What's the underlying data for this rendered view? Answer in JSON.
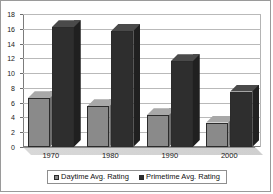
{
  "chart_data": {
    "type": "bar",
    "title": "",
    "xlabel": "",
    "ylabel": "",
    "categories": [
      "1970",
      "1980",
      "1990",
      "2000"
    ],
    "series": [
      {
        "name": "Daytime Avg. Rating",
        "color": "#8a8a8a",
        "values": [
          6.6,
          5.5,
          4.3,
          3.3
        ]
      },
      {
        "name": "Primetime Avg. Rating",
        "color": "#2e2e2e",
        "values": [
          16.2,
          15.7,
          11.6,
          7.5
        ]
      }
    ],
    "ylim": [
      0,
      18
    ],
    "yticks": [
      0,
      2,
      4,
      6,
      8,
      10,
      12,
      14,
      16,
      18
    ],
    "ytick_labels": [
      "0",
      "2",
      "4",
      "6",
      "8",
      "10",
      "12",
      "14",
      "16",
      "18"
    ],
    "grid": true,
    "legend_position": "bottom",
    "style": "3d-column"
  },
  "legend": {
    "entries": [
      {
        "label": "Daytime Avg. Rating",
        "swatch": "legend-swatch-daytime"
      },
      {
        "label": "Primetime Avg. Rating",
        "swatch": "legend-swatch-primetime"
      }
    ]
  }
}
